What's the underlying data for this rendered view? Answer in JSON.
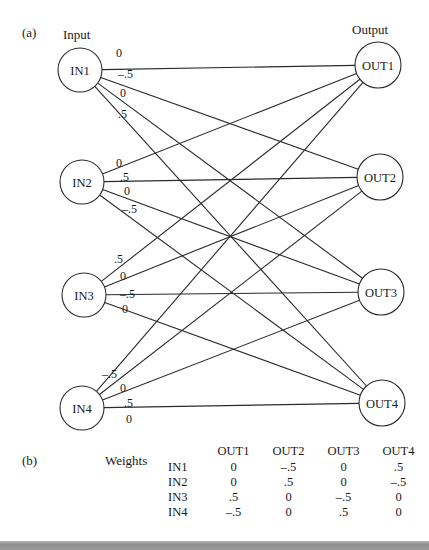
{
  "panel_a": {
    "label": "(a)",
    "input_heading": "Input",
    "output_heading": "Output",
    "inputs": [
      {
        "id": "IN1",
        "cx": 80,
        "cy": 70,
        "r": 22
      },
      {
        "id": "IN2",
        "cx": 82,
        "cy": 182,
        "r": 22
      },
      {
        "id": "IN3",
        "cx": 84,
        "cy": 295,
        "r": 22
      },
      {
        "id": "IN4",
        "cx": 82,
        "cy": 408,
        "r": 22
      }
    ],
    "outputs": [
      {
        "id": "OUT1",
        "cx": 378,
        "cy": 65,
        "r": 23
      },
      {
        "id": "OUT2",
        "cx": 380,
        "cy": 177,
        "r": 23
      },
      {
        "id": "OUT3",
        "cx": 381,
        "cy": 292,
        "r": 23
      },
      {
        "id": "OUT4",
        "cx": 382,
        "cy": 403,
        "r": 23
      }
    ],
    "edge_labels": [
      [
        "0",
        "-.5",
        "0",
        ".5"
      ],
      [
        "0",
        ".5",
        "0",
        "-.5"
      ],
      [
        ".5",
        "0",
        "-.5",
        "0"
      ],
      [
        "-.5",
        "0",
        ".5",
        "0"
      ]
    ],
    "edge_label_positions": [
      [
        [
          116,
          57
        ],
        [
          118,
          78
        ],
        [
          120,
          97
        ],
        [
          118,
          118
        ]
      ],
      [
        [
          116,
          167
        ],
        [
          120,
          181
        ],
        [
          124,
          195
        ],
        [
          122,
          213
        ]
      ],
      [
        [
          114,
          263
        ],
        [
          120,
          280
        ],
        [
          120,
          298
        ],
        [
          122,
          313
        ]
      ],
      [
        [
          102,
          378
        ],
        [
          120,
          392
        ],
        [
          124,
          407
        ],
        [
          126,
          423
        ]
      ]
    ]
  },
  "panel_b": {
    "label": "(b)",
    "title": "Weights",
    "columns": [
      "OUT1",
      "OUT2",
      "OUT3",
      "OUT4"
    ],
    "rows": [
      {
        "name": "IN1",
        "values": [
          "0",
          "–.5",
          "0",
          ".5"
        ]
      },
      {
        "name": "IN2",
        "values": [
          "0",
          ".5",
          "0",
          "–.5"
        ]
      },
      {
        "name": "IN3",
        "values": [
          ".5",
          "0",
          "–.5",
          "0"
        ]
      },
      {
        "name": "IN4",
        "values": [
          "–.5",
          "0",
          ".5",
          "0"
        ]
      }
    ]
  },
  "colors": {
    "stroke": "#2a2a2a",
    "text": "#1a1a1a",
    "background": "#ffffff",
    "bottom_bar": "#9a9a9a"
  }
}
